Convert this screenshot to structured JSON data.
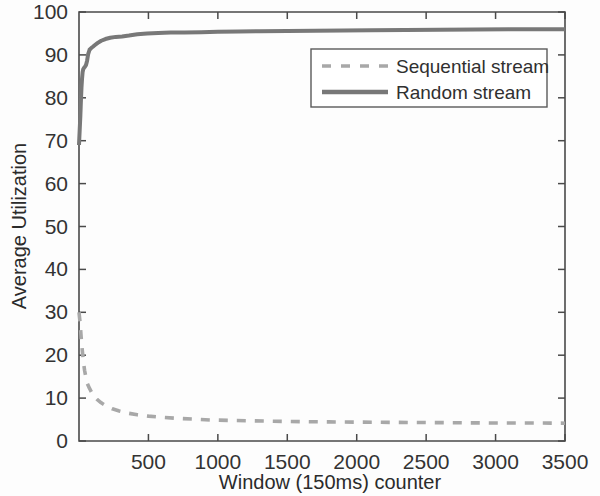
{
  "chart_data": {
    "type": "line",
    "title": "",
    "xlabel": "Window (150ms) counter",
    "ylabel": "Average Utilization",
    "xlim": [
      0,
      3500
    ],
    "ylim": [
      0,
      100
    ],
    "xticks": [
      0,
      500,
      1000,
      1500,
      2000,
      2500,
      3000,
      3500
    ],
    "xticklabels": [
      "",
      "500",
      "1000",
      "1500",
      "2000",
      "2500",
      "3000",
      "3500"
    ],
    "yticks": [
      0,
      10,
      20,
      30,
      40,
      50,
      60,
      70,
      80,
      90,
      100
    ],
    "yticklabels": [
      "0",
      "10",
      "20",
      "30",
      "40",
      "50",
      "60",
      "70",
      "80",
      "90",
      "100"
    ],
    "grid": false,
    "legend_position": "upper center",
    "series": [
      {
        "name": "Sequential stream",
        "style": "dashed",
        "color": "#a8a8a8",
        "x": [
          0,
          8,
          16,
          24,
          32,
          40,
          50,
          60,
          75,
          90,
          110,
          130,
          160,
          200,
          240,
          290,
          350,
          420,
          500,
          600,
          700,
          820,
          950,
          1100,
          1250,
          1400,
          1600,
          1800,
          2000,
          2250,
          2500,
          2750,
          3000,
          3250,
          3500
        ],
        "y": [
          30.0,
          27.5,
          24.0,
          21.0,
          18.5,
          16.5,
          14.8,
          13.4,
          12.3,
          11.4,
          10.4,
          9.7,
          8.9,
          8.1,
          7.5,
          7.0,
          6.5,
          6.1,
          5.8,
          5.5,
          5.3,
          5.1,
          4.9,
          4.8,
          4.7,
          4.6,
          4.5,
          4.45,
          4.4,
          4.35,
          4.3,
          4.25,
          4.2,
          4.2,
          4.15
        ]
      },
      {
        "name": "Random stream",
        "style": "solid",
        "color": "#787878",
        "x": [
          0,
          5,
          10,
          14,
          18,
          22,
          26,
          30,
          36,
          42,
          50,
          58,
          66,
          76,
          88,
          100,
          115,
          135,
          160,
          190,
          225,
          265,
          310,
          360,
          420,
          490,
          570,
          660,
          760,
          880,
          1000,
          1150,
          1300,
          1500,
          1700,
          1900,
          2100,
          2350,
          2600,
          2850,
          3100,
          3350,
          3500
        ],
        "y": [
          69.0,
          72.5,
          76.0,
          79.5,
          82.5,
          84.5,
          86.0,
          86.6,
          87.0,
          87.2,
          87.6,
          88.6,
          90.2,
          91.2,
          91.6,
          91.9,
          92.3,
          92.8,
          93.3,
          93.7,
          94.0,
          94.2,
          94.3,
          94.5,
          94.8,
          95.0,
          95.1,
          95.2,
          95.25,
          95.3,
          95.4,
          95.45,
          95.5,
          95.6,
          95.65,
          95.7,
          95.75,
          95.8,
          95.85,
          95.9,
          95.95,
          96.0,
          96.0
        ]
      }
    ]
  },
  "legend": {
    "entries": [
      {
        "label": "Sequential stream"
      },
      {
        "label": "Random stream"
      }
    ]
  },
  "axes": {
    "y_title": "Average Utilization",
    "x_title": "Window (150ms) counter"
  },
  "colors": {
    "sequential": "#a8a8a8",
    "random": "#787878",
    "axis": "#4a4a4a",
    "text": "#2b2b2b",
    "background": "#fdfdfd"
  }
}
